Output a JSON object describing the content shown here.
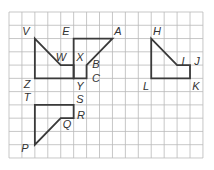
{
  "diagram": {
    "type": "coordinate-grid-figures",
    "grid": {
      "columns": 15,
      "rows": 11,
      "origin_px": [
        9,
        12
      ],
      "cell_w": 12.93,
      "cell_h": 13.27,
      "line_color": "#b9b9b9"
    },
    "shape_color": "#3a3a3a",
    "label_color": "#333333",
    "shapes": [
      {
        "name": "VWZ-figure",
        "vertices": [
          [
            2,
            2
          ],
          [
            4,
            4
          ],
          [
            5,
            4
          ],
          [
            5,
            5
          ],
          [
            2,
            5
          ]
        ],
        "labels": [
          "V",
          "W",
          "Z"
        ]
      },
      {
        "name": "EABCY-figure",
        "vertices": [
          [
            5,
            2
          ],
          [
            8,
            2
          ],
          [
            6,
            4
          ],
          [
            6,
            5
          ],
          [
            5,
            5
          ]
        ],
        "labels": [
          "E",
          "A",
          "X",
          "B",
          "C",
          "Y"
        ]
      },
      {
        "name": "HIJKL-figure",
        "vertices": [
          [
            11,
            2
          ],
          [
            13,
            4
          ],
          [
            14,
            4
          ],
          [
            14,
            5
          ],
          [
            11,
            5
          ]
        ],
        "labels": [
          "H",
          "I",
          "J",
          "K",
          "L"
        ]
      },
      {
        "name": "TSRQP-figure",
        "vertices": [
          [
            2,
            7
          ],
          [
            5,
            7
          ],
          [
            5,
            8
          ],
          [
            4,
            8
          ],
          [
            2,
            10
          ]
        ],
        "labels": [
          "T",
          "S",
          "R",
          "Q",
          "P"
        ]
      }
    ],
    "labels": [
      {
        "text": "V",
        "x": 26,
        "y": 31
      },
      {
        "text": "E",
        "x": 66,
        "y": 31
      },
      {
        "text": "A",
        "x": 118,
        "y": 31
      },
      {
        "text": "H",
        "x": 157,
        "y": 31
      },
      {
        "text": "W",
        "x": 61,
        "y": 57
      },
      {
        "text": "X",
        "x": 80,
        "y": 57
      },
      {
        "text": "B",
        "x": 96,
        "y": 64
      },
      {
        "text": "I",
        "x": 183,
        "y": 61
      },
      {
        "text": "J",
        "x": 197,
        "y": 61
      },
      {
        "text": "C",
        "x": 96,
        "y": 78
      },
      {
        "text": "Z",
        "x": 27,
        "y": 84
      },
      {
        "text": "Y",
        "x": 80,
        "y": 86
      },
      {
        "text": "L",
        "x": 146,
        "y": 86
      },
      {
        "text": "K",
        "x": 196,
        "y": 86
      },
      {
        "text": "T",
        "x": 27,
        "y": 97
      },
      {
        "text": "S",
        "x": 80,
        "y": 99
      },
      {
        "text": "R",
        "x": 81,
        "y": 115
      },
      {
        "text": "Q",
        "x": 67,
        "y": 124
      },
      {
        "text": "P",
        "x": 25,
        "y": 148
      }
    ]
  }
}
